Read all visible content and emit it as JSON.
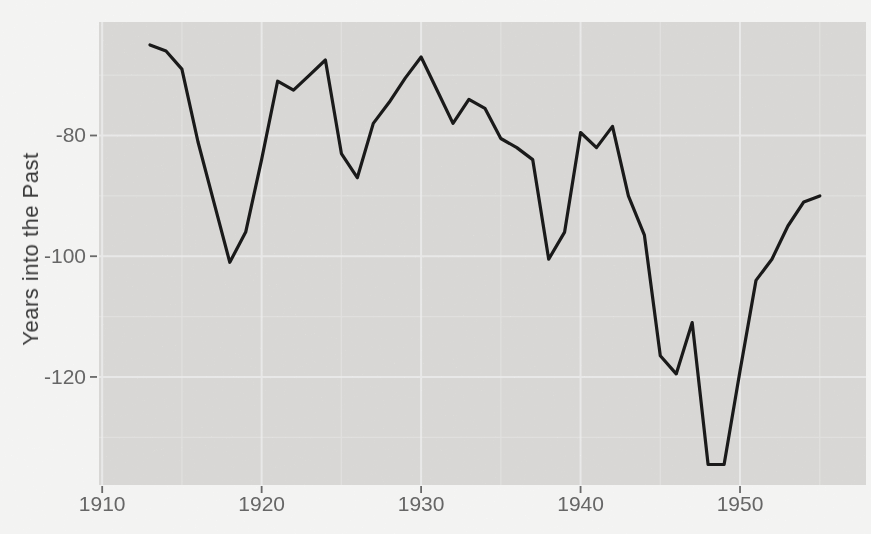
{
  "chart_data": {
    "type": "line",
    "title": "",
    "xlabel": "",
    "ylabel": "Years into the Past",
    "legend": "none",
    "grid": "white major and faint minor gridlines on gray panel (ggplot style)",
    "xlim": [
      1909.8,
      1957.9
    ],
    "ylim": [
      -137.9,
      -61.2
    ],
    "x_ticks": [
      1910,
      1920,
      1930,
      1940,
      1950
    ],
    "x_tick_labels": [
      "1910",
      "1920",
      "1930",
      "1940",
      "1950"
    ],
    "y_ticks": [
      -80,
      -100,
      -120
    ],
    "y_tick_labels": [
      "-80",
      "-100",
      "-120"
    ],
    "x_minor_ticks": [
      1915,
      1925,
      1935,
      1945,
      1955
    ],
    "y_minor_ticks": [
      -70,
      -90,
      -110,
      -130
    ],
    "series": [
      {
        "name": "years-into-the-past",
        "x": [
          1913,
          1914,
          1915,
          1916,
          1917,
          1918,
          1919,
          1920,
          1921,
          1922,
          1923,
          1924,
          1925,
          1926,
          1927,
          1928,
          1929,
          1930,
          1931,
          1932,
          1933,
          1934,
          1935,
          1936,
          1937,
          1938,
          1939,
          1940,
          1941,
          1942,
          1943,
          1944,
          1945,
          1946,
          1947,
          1948,
          1949,
          1950,
          1951,
          1952,
          1953,
          1954,
          1955
        ],
        "values": [
          -65,
          -66,
          -69,
          -81,
          -91,
          -101,
          -96,
          -84,
          -71,
          -72.5,
          -70,
          -67.5,
          -83,
          -87,
          -78,
          -74.5,
          -70.5,
          -67,
          -72.5,
          -78,
          -74,
          -75.5,
          -80.5,
          -82,
          -84,
          -100.5,
          -96,
          -79.5,
          -82,
          -78.5,
          -90,
          -96.5,
          -116.5,
          -119.5,
          -111,
          -134.5,
          -134.5,
          -119,
          -104,
          -100.5,
          -95,
          -91,
          -90
        ]
      }
    ],
    "style": {
      "panel_bg": "#eae9e6",
      "outer_bg": "#fdfdfc",
      "line_color": "#1d1d1d",
      "line_width": 3.2,
      "grid_major_color": "#ffffff",
      "grid_minor_color": "#ffffff",
      "tick_mark_color": "#6e6e6e",
      "tick_label_color": "#6b6b6b",
      "axis_title_color": "#3a3a3a"
    }
  }
}
